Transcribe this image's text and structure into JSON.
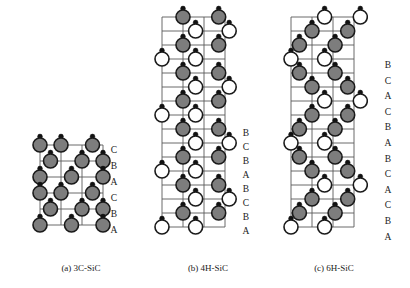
{
  "figure": {
    "background_color": "#ffffff",
    "grid_line_color": "#5a5a5a",
    "si_atom_color": "#7d7d7d",
    "si_atom_stroke": "#1a1a1a",
    "c_atom_color": "#ffffff",
    "c_atom_stroke": "#1a1a1a",
    "bond_dot_color": "#111111",
    "text_color": "#1a1a1a"
  },
  "panels": [
    {
      "id": "3c-sic",
      "caption": "(a) 3C-SiC",
      "polytype": "3C-SiC",
      "stacking_sequence": [
        "C",
        "B",
        "A",
        "C",
        "B",
        "A"
      ],
      "stacking_period": 3,
      "origin_x": 40,
      "origin_y": 145,
      "cell_w": 21,
      "cell_h": 16,
      "cols": 3,
      "rows": 6,
      "atom_radius": 7.0,
      "dot_radius": 2.4,
      "dot_offset_y": -8.5,
      "label_x": 108,
      "label_top": 146,
      "label_step": 16,
      "caption_x": 33,
      "caption_y": 263,
      "caption_w": 96,
      "atoms": [
        {
          "col": 1.0,
          "row": 0.0,
          "type": "si"
        },
        {
          "col": 2.5,
          "row": 0.0,
          "type": "si"
        },
        {
          "col": 0.0,
          "row": 0.0,
          "type": "si"
        },
        {
          "col": 0.5,
          "row": 1.0,
          "type": "si"
        },
        {
          "col": 2.0,
          "row": 1.0,
          "type": "si"
        },
        {
          "col": 3.0,
          "row": 1.0,
          "type": "si"
        },
        {
          "col": 0.0,
          "row": 2.0,
          "type": "si"
        },
        {
          "col": 1.5,
          "row": 2.0,
          "type": "si"
        },
        {
          "col": 3.0,
          "row": 2.0,
          "type": "si"
        },
        {
          "col": 1.0,
          "row": 3.0,
          "type": "si"
        },
        {
          "col": 2.5,
          "row": 3.0,
          "type": "si"
        },
        {
          "col": 0.0,
          "row": 3.0,
          "type": "si"
        },
        {
          "col": 0.5,
          "row": 4.0,
          "type": "si"
        },
        {
          "col": 2.0,
          "row": 4.0,
          "type": "si"
        },
        {
          "col": 3.0,
          "row": 4.0,
          "type": "si"
        },
        {
          "col": 0.0,
          "row": 5.0,
          "type": "si"
        },
        {
          "col": 1.5,
          "row": 5.0,
          "type": "si"
        },
        {
          "col": 3.0,
          "row": 5.0,
          "type": "si"
        }
      ]
    },
    {
      "id": "4h-sic",
      "caption": "(b) 4H-SiC",
      "polytype": "4H-SiC",
      "stacking_sequence": [
        "B",
        "C",
        "B",
        "A",
        "B",
        "C",
        "B",
        "A"
      ],
      "stacking_period": 4,
      "origin_x": 162,
      "origin_y": 17,
      "cell_w": 21,
      "cell_h": 14,
      "cols": 3,
      "rows": 16,
      "atom_radius": 7.0,
      "dot_radius": 2.4,
      "dot_offset_y": -8.5,
      "label_x": 240,
      "label_top": 129,
      "label_step": 14,
      "caption_x": 160,
      "caption_y": 263,
      "caption_w": 96,
      "atoms": [
        {
          "col": 1.0,
          "row": 0.0,
          "type": "si"
        },
        {
          "col": 2.7,
          "row": 0.0,
          "type": "si"
        },
        {
          "col": 1.6,
          "row": 1.0,
          "type": "c"
        },
        {
          "col": 3.2,
          "row": 1.0,
          "type": "c"
        },
        {
          "col": 1.0,
          "row": 2.0,
          "type": "si"
        },
        {
          "col": 2.7,
          "row": 2.0,
          "type": "si"
        },
        {
          "col": 0.0,
          "row": 3.0,
          "type": "c"
        },
        {
          "col": 1.6,
          "row": 3.0,
          "type": "c"
        },
        {
          "col": 1.0,
          "row": 4.0,
          "type": "si"
        },
        {
          "col": 2.7,
          "row": 4.0,
          "type": "si"
        },
        {
          "col": 1.6,
          "row": 5.0,
          "type": "c"
        },
        {
          "col": 3.2,
          "row": 5.0,
          "type": "c"
        },
        {
          "col": 1.0,
          "row": 6.0,
          "type": "si"
        },
        {
          "col": 2.7,
          "row": 6.0,
          "type": "si"
        },
        {
          "col": 0.0,
          "row": 7.0,
          "type": "c"
        },
        {
          "col": 1.6,
          "row": 7.0,
          "type": "c"
        },
        {
          "col": 1.0,
          "row": 8.0,
          "type": "si"
        },
        {
          "col": 2.7,
          "row": 8.0,
          "type": "si"
        },
        {
          "col": 1.6,
          "row": 9.0,
          "type": "c"
        },
        {
          "col": 3.2,
          "row": 9.0,
          "type": "c"
        },
        {
          "col": 1.0,
          "row": 10.0,
          "type": "si"
        },
        {
          "col": 2.7,
          "row": 10.0,
          "type": "si"
        },
        {
          "col": 0.0,
          "row": 11.0,
          "type": "c"
        },
        {
          "col": 1.6,
          "row": 11.0,
          "type": "c"
        },
        {
          "col": 1.0,
          "row": 12.0,
          "type": "si"
        },
        {
          "col": 2.7,
          "row": 12.0,
          "type": "si"
        },
        {
          "col": 1.6,
          "row": 13.0,
          "type": "c"
        },
        {
          "col": 3.2,
          "row": 13.0,
          "type": "c"
        },
        {
          "col": 1.0,
          "row": 14.0,
          "type": "si"
        },
        {
          "col": 2.7,
          "row": 14.0,
          "type": "si"
        },
        {
          "col": 0.0,
          "row": 15.0,
          "type": "c"
        },
        {
          "col": 1.6,
          "row": 15.0,
          "type": "c"
        }
      ]
    },
    {
      "id": "6h-sic",
      "caption": "(c) 6H-SiC",
      "polytype": "6H-SiC",
      "stacking_sequence": [
        "B",
        "C",
        "A",
        "C",
        "B",
        "A",
        "B",
        "C",
        "A",
        "C",
        "B",
        "A"
      ],
      "stacking_period": 6,
      "origin_x": 291,
      "origin_y": 17,
      "cell_w": 21,
      "cell_h": 14,
      "cols": 3,
      "rows": 16,
      "atom_radius": 7.0,
      "dot_radius": 2.4,
      "dot_offset_y": -8.5,
      "label_x": 382,
      "label_top": 61,
      "label_step": 15.6,
      "caption_x": 286,
      "caption_y": 263,
      "caption_w": 96,
      "atoms": [
        {
          "col": 1.6,
          "row": 0.0,
          "type": "c"
        },
        {
          "col": 3.3,
          "row": 0.0,
          "type": "c"
        },
        {
          "col": 1.0,
          "row": 1.0,
          "type": "si"
        },
        {
          "col": 2.7,
          "row": 1.0,
          "type": "si"
        },
        {
          "col": 0.4,
          "row": 2.0,
          "type": "si"
        },
        {
          "col": 2.1,
          "row": 2.0,
          "type": "si"
        },
        {
          "col": 0.0,
          "row": 3.0,
          "type": "c"
        },
        {
          "col": 1.6,
          "row": 3.0,
          "type": "c"
        },
        {
          "col": 0.4,
          "row": 4.0,
          "type": "si"
        },
        {
          "col": 2.1,
          "row": 4.0,
          "type": "si"
        },
        {
          "col": 1.0,
          "row": 5.0,
          "type": "si"
        },
        {
          "col": 2.7,
          "row": 5.0,
          "type": "si"
        },
        {
          "col": 1.6,
          "row": 6.0,
          "type": "c"
        },
        {
          "col": 3.3,
          "row": 6.0,
          "type": "c"
        },
        {
          "col": 1.0,
          "row": 7.0,
          "type": "si"
        },
        {
          "col": 2.7,
          "row": 7.0,
          "type": "si"
        },
        {
          "col": 0.4,
          "row": 8.0,
          "type": "si"
        },
        {
          "col": 2.1,
          "row": 8.0,
          "type": "si"
        },
        {
          "col": 0.0,
          "row": 9.0,
          "type": "c"
        },
        {
          "col": 1.6,
          "row": 9.0,
          "type": "c"
        },
        {
          "col": 0.4,
          "row": 10.0,
          "type": "si"
        },
        {
          "col": 2.1,
          "row": 10.0,
          "type": "si"
        },
        {
          "col": 1.0,
          "row": 11.0,
          "type": "si"
        },
        {
          "col": 2.7,
          "row": 11.0,
          "type": "si"
        },
        {
          "col": 1.6,
          "row": 12.0,
          "type": "c"
        },
        {
          "col": 3.3,
          "row": 12.0,
          "type": "c"
        },
        {
          "col": 1.0,
          "row": 13.0,
          "type": "si"
        },
        {
          "col": 2.7,
          "row": 13.0,
          "type": "si"
        },
        {
          "col": 0.4,
          "row": 14.0,
          "type": "si"
        },
        {
          "col": 2.1,
          "row": 14.0,
          "type": "si"
        },
        {
          "col": 0.0,
          "row": 15.0,
          "type": "c"
        },
        {
          "col": 1.6,
          "row": 15.0,
          "type": "c"
        }
      ]
    }
  ]
}
